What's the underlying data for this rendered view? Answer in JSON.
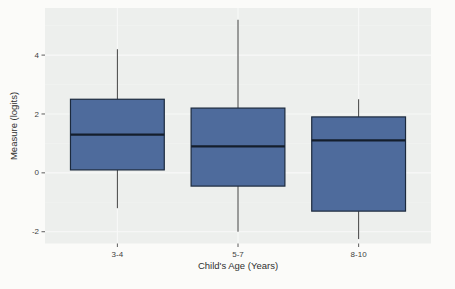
{
  "figure": {
    "background": "#fbfbf9",
    "panel_background": "#edefed",
    "grid_major_color": "#f8f9f8",
    "grid_minor_color": "#f3f5f3",
    "box_fill": "#4e6b9c",
    "box_border": "#1c2a3e",
    "median_color": "#141e2c",
    "whisker_color": "#404040",
    "tick_color": "#333333"
  },
  "chart_data": {
    "type": "boxplot",
    "title": "",
    "xlabel": "Child's Age (Years)",
    "ylabel": "Measure (logits)",
    "categories": [
      "3-4",
      "5-7",
      "8-10"
    ],
    "y_ticks": [
      -2,
      0,
      2,
      4
    ],
    "ylim": [
      -2.4,
      5.6
    ],
    "grid": true,
    "legend": "none",
    "boxes": [
      {
        "category": "3-4",
        "whisker_low": -1.2,
        "q1": 0.1,
        "median": 1.3,
        "q3": 2.5,
        "whisker_high": 4.2
      },
      {
        "category": "5-7",
        "whisker_low": -2.0,
        "q1": -0.45,
        "median": 0.9,
        "q3": 2.2,
        "whisker_high": 5.2
      },
      {
        "category": "8-10",
        "whisker_low": -2.25,
        "q1": -1.3,
        "median": 1.1,
        "q3": 1.9,
        "whisker_high": 2.5
      }
    ]
  }
}
